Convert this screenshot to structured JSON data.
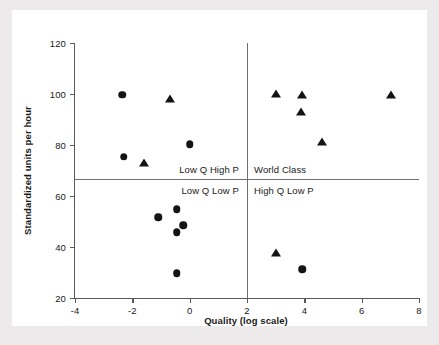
{
  "chart_data": {
    "type": "scatter",
    "title": "",
    "xlabel": "Quality (log scale)",
    "ylabel": "Standardized units per hour",
    "xlim": [
      -4,
      8
    ],
    "ylim": [
      20,
      120
    ],
    "xticks": [
      -4,
      -2,
      0,
      2,
      4,
      6,
      8
    ],
    "yticks": [
      20,
      40,
      60,
      80,
      100,
      120
    ],
    "xtick_labels": [
      "-4",
      "-2",
      "0",
      "2",
      "4",
      "6",
      "8"
    ],
    "ytick_labels": [
      "20",
      "40",
      "60",
      "80",
      "100",
      "120"
    ],
    "grid": false,
    "legend": "none",
    "quadrant_lines": {
      "x": 2,
      "y": 66.5
    },
    "quadrant_labels": [
      {
        "text": "Low Q High P",
        "x": -0.2,
        "y": 70.5,
        "align": "right"
      },
      {
        "text": "World Class",
        "x": 2.3,
        "y": 70.5,
        "align": "left"
      },
      {
        "text": "Low Q Low P",
        "x": -0.2,
        "y": 62.5,
        "align": "right"
      },
      {
        "text": "High Q Low P",
        "x": 2.3,
        "y": 62.5,
        "align": "left"
      }
    ],
    "series": [
      {
        "name": "circle",
        "marker": "circle",
        "color": "#141414",
        "points": [
          {
            "x": -2.35,
            "y": 99.8
          },
          {
            "x": -2.3,
            "y": 75.3
          },
          {
            "x": 0.0,
            "y": 80.3
          },
          {
            "x": -1.1,
            "y": 51.6
          },
          {
            "x": -0.45,
            "y": 54.8
          },
          {
            "x": -0.23,
            "y": 48.6
          },
          {
            "x": -0.45,
            "y": 45.7
          },
          {
            "x": -0.45,
            "y": 29.8
          },
          {
            "x": 3.92,
            "y": 31.3
          }
        ]
      },
      {
        "name": "triangle",
        "marker": "triangle",
        "color": "#141414",
        "points": [
          {
            "x": -0.7,
            "y": 98.2
          },
          {
            "x": -1.58,
            "y": 72.8
          },
          {
            "x": 3.02,
            "y": 99.9
          },
          {
            "x": 3.93,
            "y": 99.8
          },
          {
            "x": 3.9,
            "y": 93.0
          },
          {
            "x": 4.62,
            "y": 81.2
          },
          {
            "x": 7.02,
            "y": 99.8
          },
          {
            "x": 3.02,
            "y": 37.8
          }
        ]
      }
    ]
  }
}
